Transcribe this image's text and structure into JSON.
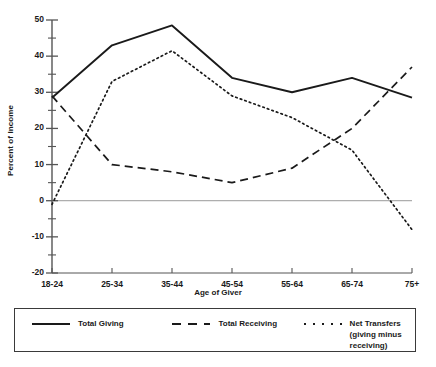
{
  "chart_data": {
    "type": "line",
    "title": "",
    "xlabel": "Age of Giver",
    "ylabel": "Percent of Income",
    "categories": [
      "18-24",
      "25-34",
      "35-44",
      "45-54",
      "55-64",
      "65-74",
      "75+"
    ],
    "ylim": [
      -20,
      50
    ],
    "ytick_labels": [
      "50",
      "40",
      "30",
      "20",
      "10",
      "0",
      "-10",
      "-20"
    ],
    "ytick_values": [
      50,
      40,
      30,
      20,
      10,
      0,
      -10,
      -20
    ],
    "minor_tick_step": 5,
    "grid": false,
    "zero_line": true,
    "legend_position": "bottom",
    "series": [
      {
        "name": "Total Giving",
        "style": "solid",
        "color": "#1a1a1a",
        "values": [
          28.5,
          43,
          48.5,
          34,
          30,
          34,
          28.5
        ]
      },
      {
        "name": "Total Receiving",
        "style": "dashed",
        "color": "#1a1a1a",
        "values": [
          29,
          10,
          8,
          5,
          9,
          20,
          37
        ]
      },
      {
        "name": "Net Transfers (giving minus receiving)",
        "style": "dotted",
        "color": "#1a1a1a",
        "values": [
          -1,
          33,
          41.5,
          29,
          23,
          14,
          -8
        ]
      }
    ]
  },
  "legend": {
    "items": [
      {
        "label": "Total Giving",
        "style": "solid"
      },
      {
        "label": "Total Receiving",
        "style": "dashed"
      },
      {
        "label": "Net Transfers (giving minus receiving)",
        "style": "dotted"
      }
    ]
  },
  "axes": {
    "y_title": "Percent of Income",
    "x_title": "Age of Giver"
  }
}
